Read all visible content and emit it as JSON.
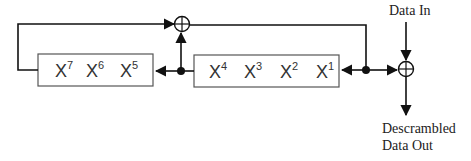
{
  "diagram": {
    "type": "descrambler-lfsr",
    "labels": {
      "data_in": "Data In",
      "data_out_line1": "Descrambled",
      "data_out_line2": "Data Out"
    },
    "registers": {
      "left_box": [
        {
          "base": "X",
          "exp": "7"
        },
        {
          "base": "X",
          "exp": "6"
        },
        {
          "base": "X",
          "exp": "5"
        }
      ],
      "right_box": [
        {
          "base": "X",
          "exp": "4"
        },
        {
          "base": "X",
          "exp": "3"
        },
        {
          "base": "X",
          "exp": "2"
        },
        {
          "base": "X",
          "exp": "1"
        }
      ]
    },
    "operators": {
      "feedback_xor": "xor",
      "output_xor": "xor"
    },
    "colors": {
      "line": "#111111",
      "box_border": "#555555",
      "text": "#333333"
    }
  }
}
